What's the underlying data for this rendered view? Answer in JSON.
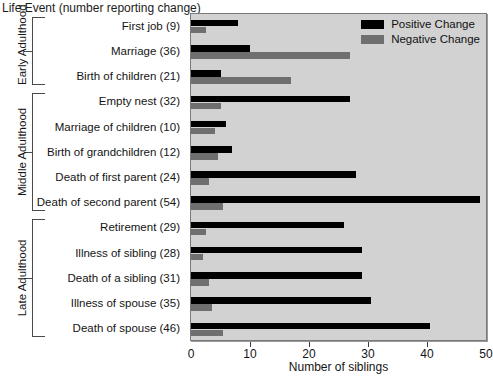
{
  "chart_data": {
    "type": "bar",
    "orientation": "horizontal",
    "title": "Life Event (number reporting change)",
    "xlabel": "Number of siblings",
    "ylabel": "",
    "xlim": [
      0,
      50
    ],
    "xticks": [
      0,
      10,
      20,
      30,
      40,
      50
    ],
    "grid": false,
    "legend_position": "top-right",
    "categories": [
      "First job (9)",
      "Marriage (36)",
      "Birth of children (21)",
      "Empty nest (32)",
      "Marriage of children (10)",
      "Birth of grandchildren (12)",
      "Death of first parent (24)",
      "Death of second parent (54)",
      "Retirement (29)",
      "Illness of sibling (28)",
      "Death of a sibling (31)",
      "Illness of spouse (35)",
      "Death of spouse (46)"
    ],
    "series": [
      {
        "name": "Positive Change",
        "color": "#000000",
        "values": [
          8,
          10,
          5,
          27,
          6,
          7,
          28,
          49,
          26,
          29,
          29,
          30.5,
          40.5
        ]
      },
      {
        "name": "Negative Change",
        "color": "#6f6f6f",
        "values": [
          2.5,
          27,
          17,
          5,
          4,
          4.5,
          3,
          5.5,
          2.5,
          2,
          3,
          3.5,
          5.5
        ]
      }
    ],
    "groups": [
      {
        "label": "Early Adulthood",
        "start_index": 0,
        "end_index": 2
      },
      {
        "label": "Middle Adulthood",
        "start_index": 3,
        "end_index": 7
      },
      {
        "label": "Late Adulthood",
        "start_index": 8,
        "end_index": 12
      }
    ]
  },
  "legend": {
    "items": [
      {
        "label": "Positive Change",
        "swatch": "positive-swatch"
      },
      {
        "label": "Negative Change",
        "swatch": "negative-swatch"
      }
    ]
  }
}
